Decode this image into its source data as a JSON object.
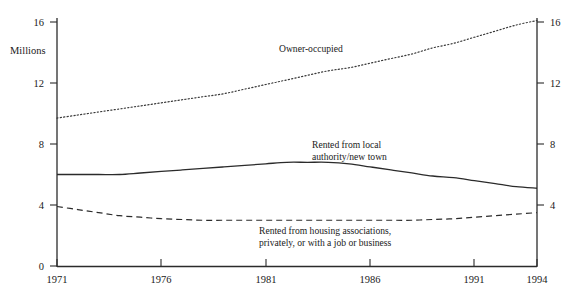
{
  "figure": {
    "cut_off_header_text": "",
    "axis_title": "Millions"
  },
  "chart_data": {
    "type": "line",
    "title": "",
    "subtitle": "",
    "xlabel": "",
    "ylabel": "Millions",
    "xlim": [
      1971,
      1994
    ],
    "ylim": [
      0,
      16
    ],
    "grid": false,
    "legend": "inline-annotations",
    "yticks": [
      0,
      4,
      8,
      12,
      16
    ],
    "ytick_labels": [
      "0",
      "4",
      "8",
      "12",
      "16"
    ],
    "ytick_labels_right": [
      "4",
      "8",
      "12",
      "16"
    ],
    "xticks": [
      1971,
      1976,
      1981,
      1986,
      1991,
      1994
    ],
    "xtick_labels": [
      "1971",
      "1976",
      "1981",
      "1986",
      "1991",
      "1994"
    ],
    "x": [
      1971,
      1972,
      1973,
      1974,
      1975,
      1976,
      1977,
      1978,
      1979,
      1980,
      1981,
      1982,
      1983,
      1984,
      1985,
      1986,
      1987,
      1988,
      1989,
      1990,
      1991,
      1992,
      1993,
      1994
    ],
    "series": [
      {
        "name": "Owner-occupied",
        "style": "dotted",
        "color": "#3a3a3a",
        "label": "Owner-occupied",
        "values": [
          9.7,
          9.9,
          10.1,
          10.3,
          10.5,
          10.7,
          10.9,
          11.1,
          11.3,
          11.6,
          11.9,
          12.2,
          12.5,
          12.8,
          13.0,
          13.3,
          13.6,
          13.9,
          14.3,
          14.6,
          15.0,
          15.4,
          15.8,
          16.1
        ]
      },
      {
        "name": "Rented from local authority/new town",
        "style": "solid",
        "color": "#2b2b2b",
        "label": "Rented from local\nauthority/new town",
        "label_line_1": "Rented from local",
        "label_line_2": "authority/new town",
        "values": [
          6.0,
          6.0,
          6.0,
          6.0,
          6.1,
          6.2,
          6.3,
          6.4,
          6.5,
          6.6,
          6.7,
          6.8,
          6.8,
          6.8,
          6.7,
          6.5,
          6.3,
          6.1,
          5.9,
          5.8,
          5.6,
          5.4,
          5.2,
          5.1
        ]
      },
      {
        "name": "Rented from housing associations, privately, or with a job or business",
        "style": "dashed",
        "color": "#2b2b2b",
        "label": "Rented from housing associations, privately, or with a job or business",
        "label_line_1": "Rented from housing associations,",
        "label_line_2": "privately, or with a job or business",
        "values": [
          3.9,
          3.7,
          3.5,
          3.3,
          3.2,
          3.1,
          3.05,
          3.0,
          3.0,
          3.0,
          3.0,
          3.0,
          3.0,
          3.0,
          3.0,
          3.0,
          3.0,
          3.0,
          3.05,
          3.1,
          3.2,
          3.3,
          3.4,
          3.5
        ]
      }
    ]
  }
}
